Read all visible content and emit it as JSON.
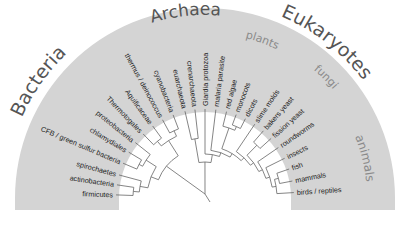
{
  "diagram": {
    "type": "radial-phylogenetic-tree",
    "center": {
      "x": 205,
      "y": 198
    },
    "outer_radius": 190,
    "inner_radius": 86,
    "colors": {
      "band": "#d4d4d4",
      "inner": "#ffffff",
      "branch": "#666666",
      "leaf_text": "#222222",
      "domain_text": "#555555",
      "group_text": "#8a8a8a"
    },
    "domains": [
      {
        "label": "Bacteria",
        "angle": 145,
        "radius": 200,
        "size": 19
      },
      {
        "label": "Archaea",
        "angle": 96,
        "radius": 183,
        "size": 17
      },
      {
        "label": "Eukaryotes",
        "angle": 52,
        "radius": 197,
        "size": 19
      }
    ],
    "groups": [
      {
        "label": "plants",
        "angle": 70,
        "radius": 165,
        "size": 11
      },
      {
        "label": "fungi",
        "angle": 45,
        "radius": 168,
        "size": 11
      },
      {
        "label": "animals",
        "angle": 14,
        "radius": 162,
        "size": 12
      }
    ],
    "leaves": [
      {
        "label": "firmicutes",
        "angle": 178,
        "domain": "Bacteria"
      },
      {
        "label": "actinobacteria",
        "angle": 171.5,
        "domain": "Bacteria"
      },
      {
        "label": "spirochaetes",
        "angle": 165,
        "domain": "Bacteria"
      },
      {
        "label": "CFB / green sulfur bacteria",
        "angle": 157,
        "domain": "Bacteria"
      },
      {
        "label": "chlamydiales",
        "angle": 149,
        "domain": "Bacteria"
      },
      {
        "label": "proteobacteria",
        "angle": 141.5,
        "domain": "Bacteria"
      },
      {
        "label": "Thermotogales",
        "angle": 134,
        "domain": "Bacteria"
      },
      {
        "label": "Aquificaceae",
        "angle": 126,
        "domain": "Bacteria"
      },
      {
        "label": "thermus / deinococcus",
        "angle": 118.5,
        "domain": "Bacteria"
      },
      {
        "label": "cyanobacteria",
        "angle": 111,
        "domain": "Bacteria"
      },
      {
        "label": "euarchaeota",
        "angle": 103,
        "domain": "Archaea"
      },
      {
        "label": "crenarchaeota",
        "angle": 96.5,
        "domain": "Archaea"
      },
      {
        "label": "Giardia protozoa",
        "angle": 90,
        "domain": "Eukaryotes"
      },
      {
        "label": "malaria parasite",
        "angle": 83,
        "domain": "Eukaryotes"
      },
      {
        "label": "red algae",
        "angle": 76,
        "domain": "Eukaryotes"
      },
      {
        "label": "monocots",
        "angle": 69.5,
        "domain": "Eukaryotes"
      },
      {
        "label": "dicots",
        "angle": 63,
        "domain": "Eukaryotes"
      },
      {
        "label": "slime molds",
        "angle": 56,
        "domain": "Eukaryotes"
      },
      {
        "label": "bakers yeast",
        "angle": 49,
        "domain": "Eukaryotes"
      },
      {
        "label": "fission yeast",
        "angle": 42,
        "domain": "Eukaryotes"
      },
      {
        "label": "roundworms",
        "angle": 34.5,
        "domain": "Eukaryotes"
      },
      {
        "label": "insects",
        "angle": 26.5,
        "domain": "Eukaryotes"
      },
      {
        "label": "fish",
        "angle": 19,
        "domain": "Eukaryotes"
      },
      {
        "label": "mammals",
        "angle": 11,
        "domain": "Eukaryotes"
      },
      {
        "label": "birds / reptiles",
        "angle": 3.5,
        "domain": "Eukaryotes"
      }
    ]
  }
}
